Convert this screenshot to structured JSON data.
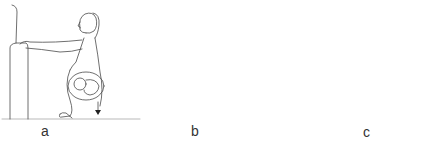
{
  "figure": {
    "colors": {
      "background": "#ffffff",
      "line": "#4a4a4a",
      "label": "#333333"
    },
    "panels": [
      {
        "id": "a",
        "label": "a",
        "scene": "pregnant woman squatting while holding the arm of a sofa, fetus visible, downward arrow"
      },
      {
        "id": "b",
        "label": "b",
        "scene": "woman squatting in a water-filled bathtub holding the rim, upward arrows along tub floor"
      },
      {
        "id": "c",
        "label": "c",
        "scene": "woman squatting while holding the edge of a support, striped body contour"
      }
    ]
  }
}
